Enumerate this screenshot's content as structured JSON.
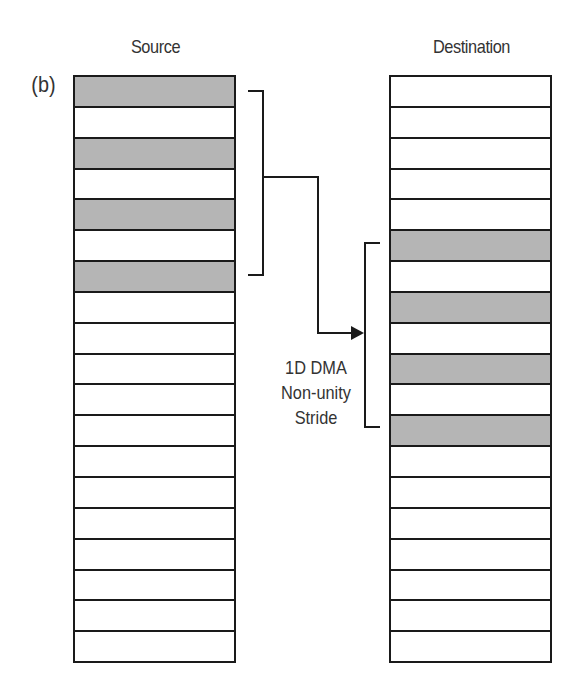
{
  "panel_label": "(b)",
  "source": {
    "title": "Source",
    "row_count": 19,
    "filled_rows": [
      0,
      2,
      4,
      6
    ]
  },
  "destination": {
    "title": "Destination",
    "row_count": 19,
    "filled_rows": [
      5,
      7,
      9,
      11
    ]
  },
  "annotation": {
    "line1": "1D DMA",
    "line2": "Non-unity",
    "line3": "Stride"
  },
  "colors": {
    "filled": "#b5b5b5",
    "empty": "#ffffff",
    "stroke": "#1a1a1a"
  }
}
